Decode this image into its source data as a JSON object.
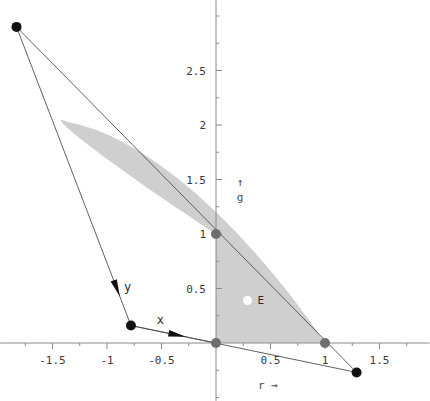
{
  "chart_data": {
    "type": "scatter",
    "title": "",
    "xlabel": "r →",
    "ylabel": "↑ g",
    "xlim": [
      -1.98,
      1.96
    ],
    "ylim": [
      -0.53,
      3.15
    ],
    "grid": false,
    "legend": "none",
    "axis_origin_px": [
      216,
      343
    ],
    "px_per_unit": 109,
    "xticks": [
      -1.5,
      -1,
      -0.5,
      0.5,
      1,
      1.5
    ],
    "xticklabels": [
      "-1.5",
      "-1",
      "-0.5",
      "0.5",
      "1",
      "1.5"
    ],
    "yticks": [
      0.5,
      1,
      1.5,
      2,
      2.5
    ],
    "yticklabels": [
      "0.5",
      "1",
      "1.5",
      "2",
      "2.5"
    ],
    "minor_tick_step": 0.25,
    "region": {
      "name": "spectral-locus-region",
      "fill": "#cfcfcf",
      "description": "shaded chromaticity region bounded by a straight chord from (0,1) to (1,0) through the origin and a curved arc",
      "polygon": [
        [
          0,
          0
        ],
        [
          1,
          0
        ],
        [
          0,
          1
        ]
      ],
      "arc_tip": [
        -1.37,
        2.03
      ]
    },
    "series": [
      {
        "name": "black-vertices",
        "marker": "filled-circle",
        "color": "#111111",
        "points": [
          {
            "label": "",
            "r": -1.83,
            "g": 2.9
          },
          {
            "label": "",
            "r": -0.78,
            "g": 0.16
          },
          {
            "label": "",
            "r": 1.29,
            "g": -0.27
          }
        ]
      },
      {
        "name": "gray-vertices",
        "marker": "filled-circle",
        "color": "#6e6e6e",
        "points": [
          {
            "label": "",
            "r": 0,
            "g": 0
          },
          {
            "label": "",
            "r": 0,
            "g": 1
          },
          {
            "label": "",
            "r": 1,
            "g": 0
          }
        ]
      },
      {
        "name": "equal-energy-point",
        "marker": "filled-circle",
        "color": "#ffffff",
        "points": [
          {
            "label": "E",
            "r": 0.29,
            "g": 0.39
          }
        ]
      }
    ],
    "vectors": [
      {
        "name": "x",
        "label": "x",
        "from": [
          -0.78,
          0.16
        ],
        "to": [
          0.0,
          0.0
        ],
        "label_pos": [
          -0.51,
          0.21
        ]
      },
      {
        "name": "y",
        "label": "y",
        "from": [
          -1.83,
          2.9
        ],
        "to": [
          -0.78,
          0.16
        ],
        "label_pos": [
          -0.81,
          0.51
        ]
      }
    ],
    "lines": [
      {
        "name": "upper-hull",
        "from": [
          -1.83,
          2.9
        ],
        "to": [
          1.29,
          -0.27
        ]
      },
      {
        "name": "lower-hull",
        "from": [
          -0.78,
          0.16
        ],
        "to": [
          1.29,
          -0.27
        ]
      }
    ],
    "annotations": [
      {
        "name": "point-label-E",
        "text": "E",
        "r": 0.41,
        "g": 0.39
      },
      {
        "name": "vector-label-x",
        "text": "x",
        "r": -0.51,
        "g": 0.21
      },
      {
        "name": "vector-label-y",
        "text": "y",
        "r": -0.81,
        "g": 0.51
      }
    ]
  },
  "axes": {
    "x_label": "r →",
    "y_label_arrow": "↑",
    "y_label_text": "g"
  },
  "colors": {
    "axis": "#8a8a8a",
    "region_fill": "#cfcfcf",
    "black_marker": "#111111",
    "gray_marker": "#6e6e6e",
    "white_marker": "#ffffff",
    "line": "#4f4f4f",
    "text": "#3a3a3a",
    "background": "#ffffff"
  }
}
